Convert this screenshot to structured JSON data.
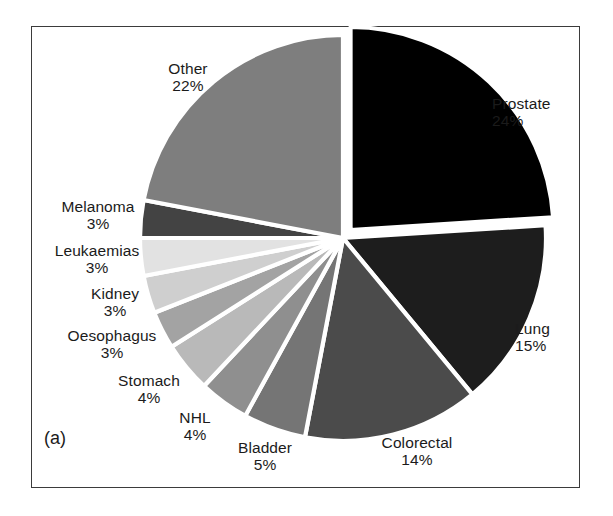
{
  "figure": {
    "panel_letter": "(a)",
    "frame_color": "#3b3b3b",
    "background": "#ffffff",
    "slice_gap_color": "#ffffff"
  },
  "chart_data": {
    "type": "pie",
    "title": "",
    "subtitle": "",
    "xlabel": "",
    "ylabel": "",
    "legend_position": "none",
    "grid": false,
    "units": "percent",
    "total": 100,
    "start_angle_deg": 0,
    "direction": "clockwise",
    "exploded_slices": [
      "Prostate"
    ],
    "categories": [
      "Prostate",
      "Lung",
      "Colorectal",
      "Bladder",
      "NHL",
      "Stomach",
      "Oesophagus",
      "Kidney",
      "Leukaemias",
      "Melanoma",
      "Other"
    ],
    "values": [
      24,
      15,
      14,
      5,
      4,
      4,
      3,
      3,
      3,
      3,
      22
    ],
    "labels": [
      "24%",
      "15%",
      "14%",
      "5%",
      "4%",
      "4%",
      "3%",
      "3%",
      "3%",
      "3%",
      "22%"
    ],
    "colors": [
      "#000000",
      "#1d1d1d",
      "#4b4b4b",
      "#757575",
      "#8f8f8f",
      "#b9b9b9",
      "#a3a3a3",
      "#cfcfcf",
      "#e2e2e2",
      "#434343",
      "#7e7e7e"
    ],
    "slices": [
      {
        "name": "Prostate",
        "value": 24,
        "percent_label": "24%",
        "color": "#000000",
        "exploded": true,
        "label_pos": "right-top"
      },
      {
        "name": "Lung",
        "value": 15,
        "percent_label": "15%",
        "color": "#1d1d1d",
        "exploded": false,
        "label_pos": "right-bottom"
      },
      {
        "name": "Colorectal",
        "value": 14,
        "percent_label": "14%",
        "color": "#4b4b4b",
        "exploded": false,
        "label_pos": "bottom-right"
      },
      {
        "name": "Bladder",
        "value": 5,
        "percent_label": "5%",
        "color": "#757575",
        "exploded": false,
        "label_pos": "bottom"
      },
      {
        "name": "NHL",
        "value": 4,
        "percent_label": "4%",
        "color": "#8f8f8f",
        "exploded": false,
        "label_pos": "bottom-left"
      },
      {
        "name": "Stomach",
        "value": 4,
        "percent_label": "4%",
        "color": "#b9b9b9",
        "exploded": false,
        "label_pos": "left-lower"
      },
      {
        "name": "Oesophagus",
        "value": 3,
        "percent_label": "3%",
        "color": "#a3a3a3",
        "exploded": false,
        "label_pos": "left"
      },
      {
        "name": "Kidney",
        "value": 3,
        "percent_label": "3%",
        "color": "#cfcfcf",
        "exploded": false,
        "label_pos": "left"
      },
      {
        "name": "Leukaemias",
        "value": 3,
        "percent_label": "3%",
        "color": "#e2e2e2",
        "exploded": false,
        "label_pos": "left-upper"
      },
      {
        "name": "Melanoma",
        "value": 3,
        "percent_label": "3%",
        "color": "#434343",
        "exploded": false,
        "label_pos": "left-upper"
      },
      {
        "name": "Other",
        "value": 22,
        "percent_label": "22%",
        "color": "#7e7e7e",
        "exploded": false,
        "label_pos": "top-left"
      }
    ]
  }
}
